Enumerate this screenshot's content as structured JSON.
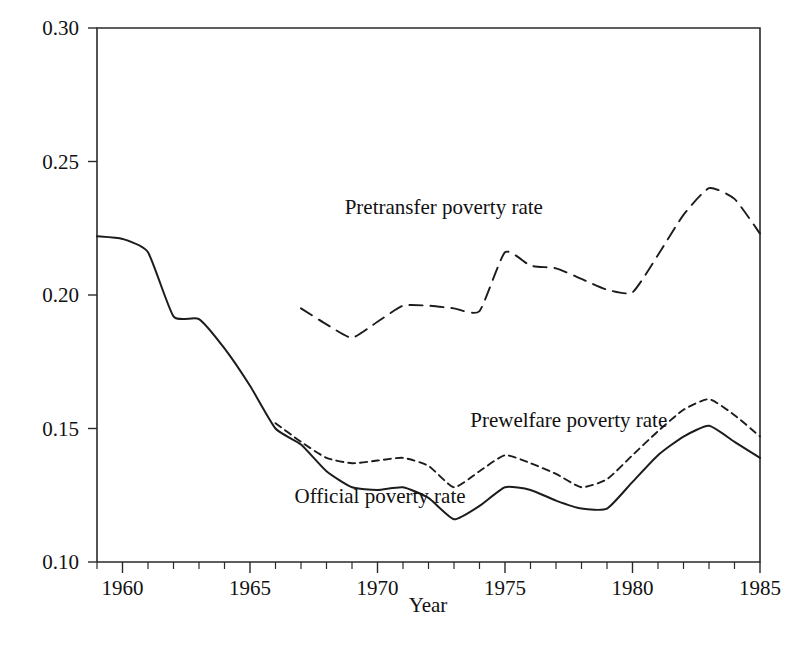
{
  "chart_data": {
    "type": "line",
    "title": "",
    "xlabel": "Year",
    "ylabel": "",
    "xlim": [
      1959,
      1985
    ],
    "ylim": [
      0.1,
      0.3
    ],
    "grid": false,
    "legend_position": "inline-annotations",
    "x_ticks": [
      1960,
      1965,
      1970,
      1975,
      1980,
      1985
    ],
    "x_tick_labels": [
      "1960",
      "1965",
      "1970",
      "1975",
      "1980",
      "1985"
    ],
    "x_minor_tick_interval": 1,
    "y_ticks": [
      0.1,
      0.15,
      0.2,
      0.25,
      0.3
    ],
    "y_tick_labels": [
      "0.10",
      "0.15",
      "0.20",
      "0.25",
      "0.30"
    ],
    "series": [
      {
        "name": "Pretransfer poverty rate",
        "style": "long-dashed",
        "color": "#1c1c1c",
        "x": [
          1967,
          1968,
          1969,
          1970,
          1971,
          1972,
          1973,
          1974,
          1975,
          1976,
          1977,
          1978,
          1979,
          1980,
          1981,
          1982,
          1983,
          1984,
          1985
        ],
        "values": [
          0.195,
          0.189,
          0.184,
          0.19,
          0.196,
          0.196,
          0.195,
          0.194,
          0.216,
          0.211,
          0.21,
          0.206,
          0.202,
          0.201,
          0.215,
          0.23,
          0.24,
          0.236,
          0.223
        ]
      },
      {
        "name": "Prewelfare poverty rate",
        "style": "short-dashed",
        "color": "#1c1c1c",
        "x": [
          1966,
          1967,
          1968,
          1969,
          1970,
          1971,
          1972,
          1973,
          1974,
          1975,
          1976,
          1977,
          1978,
          1979,
          1980,
          1981,
          1982,
          1983,
          1984,
          1985
        ],
        "values": [
          0.152,
          0.145,
          0.139,
          0.137,
          0.138,
          0.139,
          0.136,
          0.128,
          0.134,
          0.14,
          0.137,
          0.133,
          0.128,
          0.131,
          0.14,
          0.149,
          0.157,
          0.161,
          0.155,
          0.147
        ]
      },
      {
        "name": "Official poverty rate",
        "style": "solid",
        "color": "#1c1c1c",
        "x": [
          1959,
          1960,
          1961,
          1962,
          1963,
          1964,
          1965,
          1966,
          1967,
          1968,
          1969,
          1970,
          1971,
          1972,
          1973,
          1974,
          1975,
          1976,
          1977,
          1978,
          1979,
          1980,
          1981,
          1982,
          1983,
          1984,
          1985
        ],
        "values": [
          0.222,
          0.221,
          0.216,
          0.192,
          0.191,
          0.18,
          0.166,
          0.15,
          0.144,
          0.134,
          0.128,
          0.127,
          0.128,
          0.124,
          0.116,
          0.121,
          0.128,
          0.127,
          0.123,
          0.12,
          0.12,
          0.13,
          0.14,
          0.147,
          0.151,
          0.145,
          0.139
        ]
      }
    ],
    "annotations": [
      {
        "text": "Pretransfer poverty rate",
        "x": 1972.6,
        "y": 0.2305
      },
      {
        "text": "Prewelfare poverty rate",
        "x": 1977.5,
        "y": 0.1507
      },
      {
        "text": "Official poverty rate",
        "x": 1970.1,
        "y": 0.1222
      }
    ]
  },
  "axes": {
    "x_title": "Year"
  }
}
